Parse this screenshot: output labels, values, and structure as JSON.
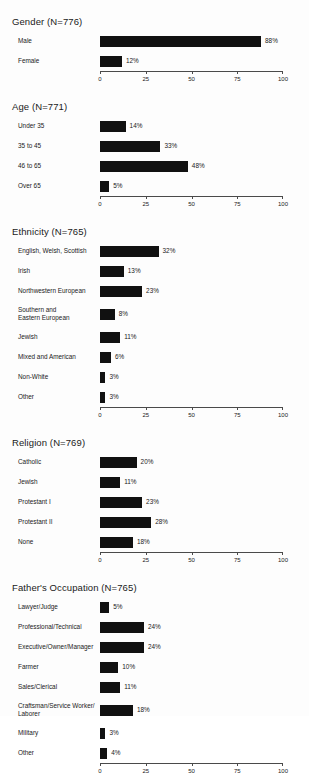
{
  "chart_data": [
    {
      "type": "bar",
      "title": "Gender (N=776)",
      "orientation": "horizontal",
      "xlabel": "",
      "ylabel": "",
      "xlim": [
        0,
        100
      ],
      "ticks": [
        0,
        25,
        50,
        75,
        100
      ],
      "tick_labels": [
        "0",
        "25",
        "50",
        "75",
        "100"
      ],
      "grid": false,
      "legend": "none",
      "categories": [
        "Male",
        "Female"
      ],
      "values": [
        88,
        12
      ],
      "value_labels": [
        "88%",
        "12%"
      ]
    },
    {
      "type": "bar",
      "title": "Age (N=771)",
      "orientation": "horizontal",
      "xlabel": "",
      "ylabel": "",
      "xlim": [
        0,
        100
      ],
      "ticks": [
        0,
        25,
        50,
        75,
        100
      ],
      "tick_labels": [
        "0",
        "25",
        "50",
        "75",
        "100"
      ],
      "grid": false,
      "legend": "none",
      "categories": [
        "Under 35",
        "35 to 45",
        "46 to 65",
        "Over 65"
      ],
      "values": [
        14,
        33,
        48,
        5
      ],
      "value_labels": [
        "14%",
        "33%",
        "48%",
        "5%"
      ]
    },
    {
      "type": "bar",
      "title": "Ethnicity (N=765)",
      "orientation": "horizontal",
      "xlabel": "",
      "ylabel": "",
      "xlim": [
        0,
        100
      ],
      "ticks": [
        0,
        25,
        50,
        75,
        100
      ],
      "tick_labels": [
        "0",
        "25",
        "50",
        "75",
        "100"
      ],
      "grid": false,
      "legend": "none",
      "categories": [
        "English, Welsh, Scottish",
        "Irish",
        "Northwestern European",
        "Southern and\nEastern European",
        "Jewish",
        "Mixed and American",
        "Non-White",
        "Other"
      ],
      "values": [
        32,
        13,
        23,
        8,
        11,
        6,
        3,
        3
      ],
      "value_labels": [
        "32%",
        "13%",
        "23%",
        "8%",
        "11%",
        "6%",
        "3%",
        "3%"
      ]
    },
    {
      "type": "bar",
      "title": "Religion (N=769)",
      "orientation": "horizontal",
      "xlabel": "",
      "ylabel": "",
      "xlim": [
        0,
        100
      ],
      "ticks": [
        0,
        25,
        50,
        75,
        100
      ],
      "tick_labels": [
        "0",
        "25",
        "50",
        "75",
        "100"
      ],
      "grid": false,
      "legend": "none",
      "categories": [
        "Catholic",
        "Jewish",
        "Protestant I",
        "Protestant II",
        "None"
      ],
      "values": [
        20,
        11,
        23,
        28,
        18
      ],
      "value_labels": [
        "20%",
        "11%",
        "23%",
        "28%",
        "18%"
      ]
    },
    {
      "type": "bar",
      "title": "Father's Occupation (N=765)",
      "orientation": "horizontal",
      "xlabel": "",
      "ylabel": "",
      "xlim": [
        0,
        100
      ],
      "ticks": [
        0,
        25,
        50,
        75,
        100
      ],
      "tick_labels": [
        "0",
        "25",
        "50",
        "75",
        "100"
      ],
      "grid": false,
      "legend": "none",
      "categories": [
        "Lawyer/Judge",
        "Professional/Technical",
        "Executive/Owner/Manager",
        "Farmer",
        "Sales/Clerical",
        "Craftsman/Service Worker/\nLaborer",
        "Military",
        "Other"
      ],
      "values": [
        5,
        24,
        24,
        10,
        11,
        18,
        3,
        4
      ],
      "value_labels": [
        "5%",
        "24%",
        "24%",
        "10%",
        "11%",
        "18%",
        "3%",
        "4%"
      ]
    }
  ],
  "style": {
    "bar_color": "#111111",
    "axis_color": "#4a4a4a",
    "text_color": "#1a1a1a",
    "background": "#fdfdfd"
  },
  "panels": {
    "gender": {
      "title": "Gender (N=776)"
    },
    "age": {
      "title": "Age (N=771)"
    },
    "ethnicity": {
      "title": "Ethnicity (N=765)"
    },
    "religion": {
      "title": "Religion (N=769)"
    },
    "occupation": {
      "title": "Father's Occupation (N=765)"
    }
  }
}
